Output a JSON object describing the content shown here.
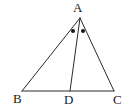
{
  "figure": {
    "kind": "geometry-diagram",
    "shape": "triangle-with-angle-bisector",
    "width": 133,
    "height": 110,
    "background_color": "#ffffff",
    "stroke_color": "#2b2b2b",
    "stroke_width": 1,
    "marker_color": "#151515",
    "label_color": "#1a1a1a"
  },
  "points": {
    "A": {
      "label": "A",
      "x": 80,
      "y": 18
    },
    "B": {
      "label": "B",
      "x": 22,
      "y": 91
    },
    "C": {
      "label": "C",
      "x": 114,
      "y": 91
    },
    "D": {
      "label": "D",
      "x": 70,
      "y": 91
    }
  },
  "segments": [
    {
      "name": "AB",
      "from": "A",
      "to": "B",
      "x1": 80,
      "y1": 18,
      "x2": 22,
      "y2": 91
    },
    {
      "name": "AC",
      "from": "A",
      "to": "C",
      "x1": 80,
      "y1": 18,
      "x2": 114,
      "y2": 91
    },
    {
      "name": "BC",
      "from": "B",
      "to": "C",
      "x1": 22,
      "y1": 91,
      "x2": 114,
      "y2": 91
    },
    {
      "name": "AD",
      "from": "A",
      "to": "D",
      "x1": 80,
      "y1": 18,
      "x2": 70,
      "y2": 91
    }
  ],
  "angle_markers": [
    {
      "name": "angle-BAD-dot",
      "angle": "BAD",
      "x": 73,
      "y": 31,
      "radius": 2
    },
    {
      "name": "angle-DAC-dot",
      "angle": "DAC",
      "x": 83,
      "y": 31,
      "radius": 2
    }
  ],
  "labels": {
    "A": "A",
    "B": "B",
    "C": "C",
    "D": "D"
  }
}
